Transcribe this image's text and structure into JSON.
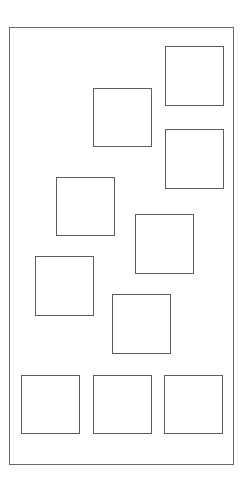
{
  "diagram": {
    "title": "",
    "stroke_color": "#5e5e5e",
    "frame_color": "#6a6a6a",
    "background": "#ffffff",
    "frame": {
      "x": 9,
      "y": 27,
      "w": 225,
      "h": 438
    },
    "boxes": [
      {
        "id": "box-1",
        "x": 165,
        "y": 46,
        "w": 59,
        "h": 60
      },
      {
        "id": "box-2",
        "x": 93,
        "y": 88,
        "w": 59,
        "h": 59
      },
      {
        "id": "box-3",
        "x": 165,
        "y": 129,
        "w": 59,
        "h": 60
      },
      {
        "id": "box-4",
        "x": 56,
        "y": 177,
        "w": 59,
        "h": 59
      },
      {
        "id": "box-5",
        "x": 135,
        "y": 214,
        "w": 59,
        "h": 60
      },
      {
        "id": "box-6",
        "x": 35,
        "y": 256,
        "w": 59,
        "h": 60
      },
      {
        "id": "box-7",
        "x": 112,
        "y": 294,
        "w": 59,
        "h": 60
      },
      {
        "id": "box-8",
        "x": 21,
        "y": 375,
        "w": 59,
        "h": 59
      },
      {
        "id": "box-9",
        "x": 93,
        "y": 375,
        "w": 59,
        "h": 59
      },
      {
        "id": "box-10",
        "x": 164,
        "y": 375,
        "w": 59,
        "h": 59
      }
    ]
  }
}
